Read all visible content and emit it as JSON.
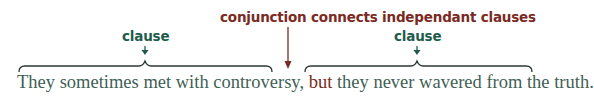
{
  "annotation": {
    "conjunction_label": "conjunction connects independant clauses",
    "clause_left_label": "clause",
    "clause_right_label": "clause"
  },
  "sentence": {
    "clause_1": "They sometimes met with controversy,",
    "conjunction": "but",
    "clause_2": "they never wavered from the truth."
  },
  "colors": {
    "conjunction": "#7a2a22",
    "clause": "#1f5b4c",
    "sentence_text": "#3f5f55"
  }
}
